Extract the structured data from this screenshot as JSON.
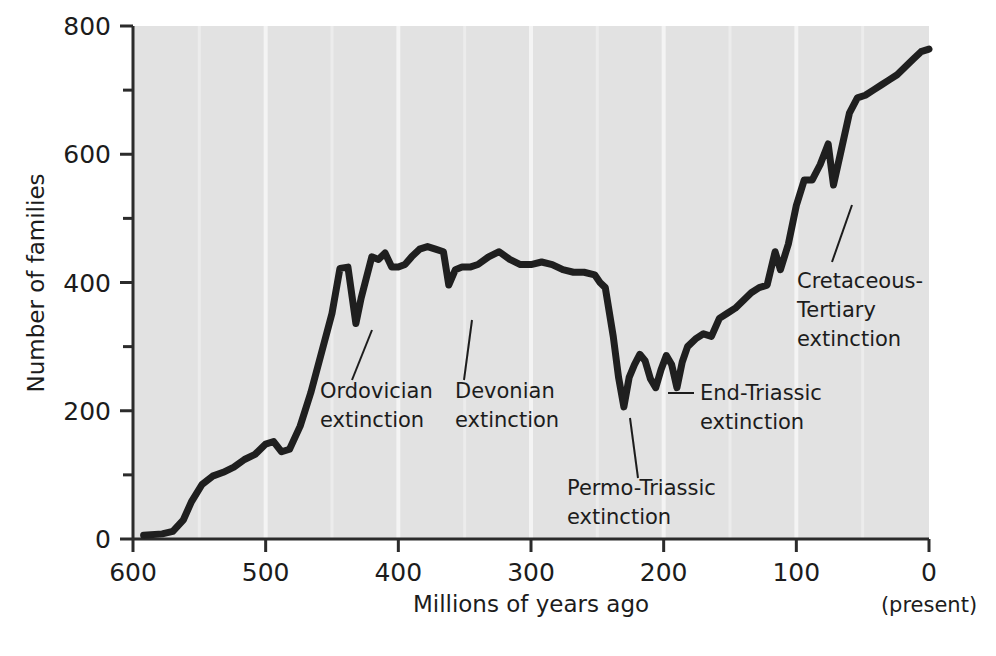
{
  "chart_data": {
    "type": "line",
    "title": "",
    "subtitle": "",
    "xlabel": "Millions of years ago",
    "ylabel": "Number of families",
    "xlim": [
      600,
      0
    ],
    "ylim": [
      0,
      800
    ],
    "x_reversed": true,
    "grid": "faint vertical gridlines only",
    "legend": "none",
    "plot_background": "#e2e2e2",
    "line_color": "#1f1f1f",
    "line_width_px": 7,
    "x_tick_labels": [
      "600",
      "500",
      "400",
      "300",
      "200",
      "100",
      "0"
    ],
    "x_ticks": [
      600,
      500,
      400,
      300,
      200,
      100,
      0
    ],
    "y_tick_labels": [
      "0",
      "200",
      "400",
      "600",
      "800"
    ],
    "y_ticks": [
      0,
      200,
      400,
      600,
      800
    ],
    "y_minor_ticks": [
      100,
      300,
      500,
      700
    ],
    "x_axis_note": "(present)",
    "x_axis_note_at": 0,
    "series": [
      {
        "name": "Number of marine animal families",
        "points": [
          [
            592,
            6
          ],
          [
            578,
            8
          ],
          [
            570,
            12
          ],
          [
            562,
            30
          ],
          [
            556,
            58
          ],
          [
            548,
            85
          ],
          [
            540,
            98
          ],
          [
            532,
            104
          ],
          [
            524,
            112
          ],
          [
            516,
            124
          ],
          [
            508,
            132
          ],
          [
            500,
            148
          ],
          [
            494,
            152
          ],
          [
            488,
            136
          ],
          [
            482,
            140
          ],
          [
            474,
            176
          ],
          [
            466,
            228
          ],
          [
            458,
            290
          ],
          [
            450,
            352
          ],
          [
            444,
            422
          ],
          [
            438,
            424
          ],
          [
            432,
            336
          ],
          [
            428,
            376
          ],
          [
            424,
            408
          ],
          [
            420,
            440
          ],
          [
            415,
            436
          ],
          [
            410,
            446
          ],
          [
            405,
            424
          ],
          [
            400,
            424
          ],
          [
            395,
            428
          ],
          [
            390,
            440
          ],
          [
            384,
            452
          ],
          [
            378,
            456
          ],
          [
            372,
            452
          ],
          [
            366,
            448
          ],
          [
            362,
            396
          ],
          [
            357,
            420
          ],
          [
            352,
            424
          ],
          [
            346,
            424
          ],
          [
            340,
            428
          ],
          [
            332,
            440
          ],
          [
            324,
            448
          ],
          [
            316,
            436
          ],
          [
            308,
            428
          ],
          [
            300,
            428
          ],
          [
            292,
            432
          ],
          [
            284,
            428
          ],
          [
            276,
            420
          ],
          [
            268,
            416
          ],
          [
            260,
            416
          ],
          [
            252,
            412
          ],
          [
            248,
            400
          ],
          [
            244,
            392
          ],
          [
            238,
            316
          ],
          [
            234,
            252
          ],
          [
            230,
            206
          ],
          [
            226,
            252
          ],
          [
            222,
            272
          ],
          [
            218,
            288
          ],
          [
            214,
            278
          ],
          [
            210,
            250
          ],
          [
            206,
            236
          ],
          [
            202,
            264
          ],
          [
            198,
            286
          ],
          [
            194,
            272
          ],
          [
            190,
            236
          ],
          [
            186,
            276
          ],
          [
            182,
            300
          ],
          [
            176,
            312
          ],
          [
            170,
            320
          ],
          [
            164,
            316
          ],
          [
            158,
            344
          ],
          [
            152,
            352
          ],
          [
            146,
            360
          ],
          [
            140,
            372
          ],
          [
            134,
            384
          ],
          [
            128,
            392
          ],
          [
            122,
            396
          ],
          [
            116,
            448
          ],
          [
            112,
            420
          ],
          [
            106,
            460
          ],
          [
            100,
            520
          ],
          [
            94,
            560
          ],
          [
            88,
            560
          ],
          [
            82,
            584
          ],
          [
            76,
            616
          ],
          [
            72,
            552
          ],
          [
            66,
            608
          ],
          [
            60,
            664
          ],
          [
            54,
            688
          ],
          [
            48,
            692
          ],
          [
            42,
            700
          ],
          [
            36,
            708
          ],
          [
            30,
            716
          ],
          [
            24,
            724
          ],
          [
            18,
            736
          ],
          [
            12,
            748
          ],
          [
            6,
            760
          ],
          [
            0,
            764
          ]
        ]
      }
    ],
    "annotations": [
      {
        "id": "ordovician",
        "lines": [
          "Ordovician",
          "extinction"
        ],
        "text": "Ordovician extinction",
        "label_x_px": 320,
        "label_y_px": 398,
        "leader_from_px": [
          352,
          380
        ],
        "leader_to_px": [
          372,
          330
        ],
        "event_myr": 440,
        "event_value": 336
      },
      {
        "id": "devonian",
        "lines": [
          "Devonian",
          "extinction"
        ],
        "text": "Devonian extinction",
        "label_x_px": 455,
        "label_y_px": 398,
        "leader_from_px": [
          464,
          380
        ],
        "leader_to_px": [
          472,
          320
        ],
        "event_myr": 362,
        "event_value": 396
      },
      {
        "id": "permo-triassic",
        "lines": [
          "Permo-Triassic",
          "extinction"
        ],
        "text": "Permo-Triassic extinction",
        "label_x_px": 567,
        "label_y_px": 495,
        "leader_from_px": [
          638,
          478
        ],
        "leader_to_px": [
          630,
          418
        ],
        "event_myr": 230,
        "event_value": 206
      },
      {
        "id": "end-triassic",
        "lines": [
          "End-Triassic",
          "extinction"
        ],
        "text": "End-Triassic extinction",
        "label_x_px": 700,
        "label_y_px": 400,
        "leader_from_px": [
          694,
          393
        ],
        "leader_to_px": [
          668,
          393
        ],
        "event_myr": 190,
        "event_value": 236
      },
      {
        "id": "cretaceous-tertiary",
        "lines": [
          "Cretaceous-",
          "Tertiary",
          "extinction"
        ],
        "text": "Cretaceous-Tertiary extinction",
        "label_x_px": 797,
        "label_y_px": 288,
        "leader_from_px": [
          832,
          262
        ],
        "leader_to_px": [
          852,
          205
        ],
        "event_myr": 72,
        "event_value": 552
      }
    ]
  },
  "geometry": {
    "plot_left_px": 133,
    "plot_right_px": 929,
    "plot_top_px": 26,
    "plot_bottom_px": 539
  }
}
